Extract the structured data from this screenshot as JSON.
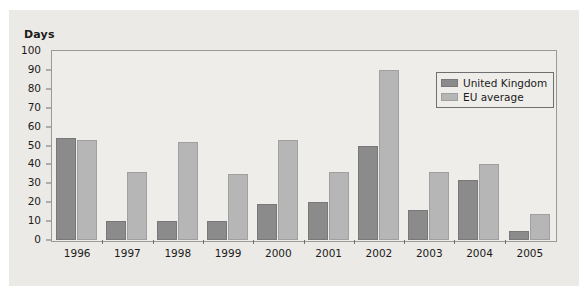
{
  "chart_data": {
    "type": "bar",
    "title": "",
    "subtitle": "",
    "xlabel": "",
    "ylabel": "Days",
    "ylim": [
      0,
      100
    ],
    "yticks": [
      0,
      10,
      20,
      30,
      40,
      50,
      60,
      70,
      80,
      90,
      100
    ],
    "grid": false,
    "legend_position": "top-right",
    "categories": [
      "1996",
      "1997",
      "1998",
      "1999",
      "2000",
      "2001",
      "2002",
      "2003",
      "2004",
      "2005"
    ],
    "series": [
      {
        "name": "United Kingdom",
        "color": "#8b8b8b",
        "values": [
          54,
          10,
          10,
          10,
          19,
          20,
          50,
          16,
          32,
          5
        ]
      },
      {
        "name": "EU average",
        "color": "#b6b6b6",
        "values": [
          53,
          36,
          52,
          35,
          53,
          36,
          90,
          36,
          40,
          14
        ]
      }
    ]
  },
  "colors": {
    "figure_background": "#eceae6",
    "plot_background": "#efedea",
    "axis_line": "#9a9a9a",
    "text": "#1b1b1b",
    "series_uk": "#8b8b8b",
    "series_eu": "#b6b6b6"
  }
}
